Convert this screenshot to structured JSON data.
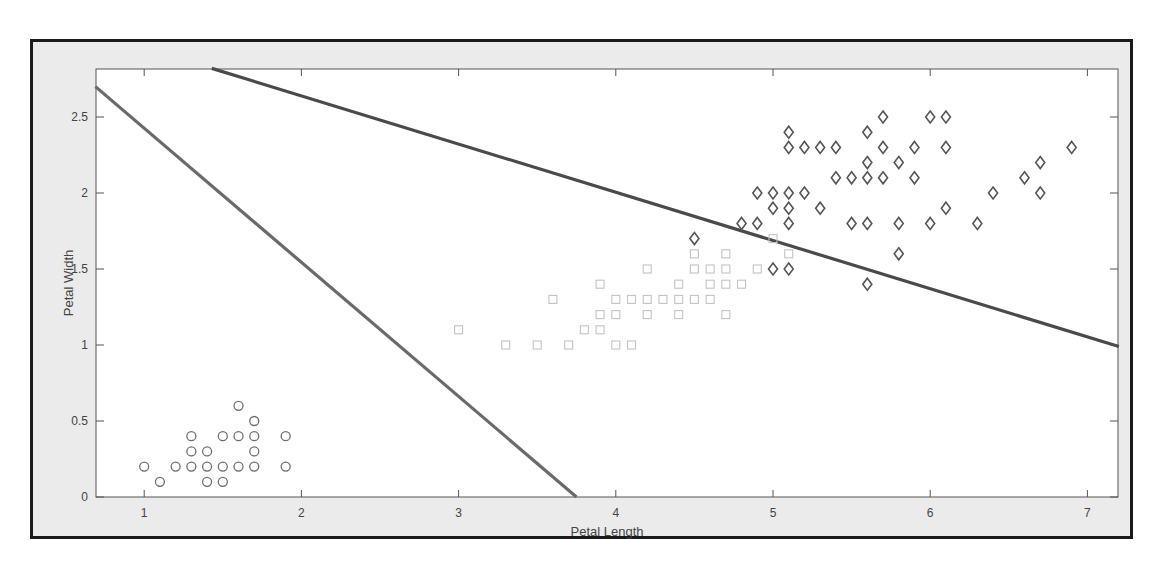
{
  "figure": {
    "frame_color": "#1a1a1a",
    "background": "#ebebeb",
    "axes_background": "#ffffff"
  },
  "chart_data": {
    "type": "scatter",
    "title": "",
    "xlabel": "Petal Length",
    "ylabel": "Petal Width",
    "xlim": [
      0.69,
      7.2
    ],
    "ylim": [
      0,
      2.82
    ],
    "xticks": [
      1,
      2,
      3,
      4,
      5,
      6,
      7
    ],
    "yticks": [
      0,
      0.5,
      1,
      1.5,
      2,
      2.5
    ],
    "xtick_labels": [
      "1",
      "2",
      "3",
      "4",
      "5",
      "6",
      "7"
    ],
    "ytick_labels": [
      "0",
      "0.5",
      "1",
      "1.5",
      "2",
      "2.5"
    ],
    "grid": false,
    "legend": null,
    "series": [
      {
        "name": "setosa",
        "marker": "circle",
        "color": "#6e6e6e",
        "points": [
          [
            1.0,
            0.2
          ],
          [
            1.1,
            0.1
          ],
          [
            1.2,
            0.2
          ],
          [
            1.3,
            0.2
          ],
          [
            1.3,
            0.3
          ],
          [
            1.3,
            0.4
          ],
          [
            1.4,
            0.1
          ],
          [
            1.4,
            0.2
          ],
          [
            1.4,
            0.3
          ],
          [
            1.5,
            0.1
          ],
          [
            1.5,
            0.2
          ],
          [
            1.5,
            0.4
          ],
          [
            1.6,
            0.2
          ],
          [
            1.6,
            0.4
          ],
          [
            1.6,
            0.6
          ],
          [
            1.7,
            0.2
          ],
          [
            1.7,
            0.3
          ],
          [
            1.7,
            0.4
          ],
          [
            1.7,
            0.5
          ],
          [
            1.9,
            0.2
          ],
          [
            1.9,
            0.4
          ]
        ]
      },
      {
        "name": "versicolor",
        "marker": "square",
        "color": "#c4c4c4",
        "points": [
          [
            3.0,
            1.1
          ],
          [
            3.3,
            1.0
          ],
          [
            3.5,
            1.0
          ],
          [
            3.6,
            1.3
          ],
          [
            3.7,
            1.0
          ],
          [
            3.8,
            1.1
          ],
          [
            3.9,
            1.1
          ],
          [
            3.9,
            1.2
          ],
          [
            3.9,
            1.4
          ],
          [
            4.0,
            1.0
          ],
          [
            4.0,
            1.2
          ],
          [
            4.0,
            1.3
          ],
          [
            4.1,
            1.0
          ],
          [
            4.1,
            1.3
          ],
          [
            4.2,
            1.2
          ],
          [
            4.2,
            1.3
          ],
          [
            4.2,
            1.5
          ],
          [
            4.3,
            1.3
          ],
          [
            4.4,
            1.2
          ],
          [
            4.4,
            1.3
          ],
          [
            4.4,
            1.4
          ],
          [
            4.5,
            1.3
          ],
          [
            4.5,
            1.5
          ],
          [
            4.5,
            1.6
          ],
          [
            4.6,
            1.3
          ],
          [
            4.6,
            1.4
          ],
          [
            4.6,
            1.5
          ],
          [
            4.7,
            1.2
          ],
          [
            4.7,
            1.4
          ],
          [
            4.7,
            1.5
          ],
          [
            4.7,
            1.6
          ],
          [
            4.8,
            1.4
          ],
          [
            4.9,
            1.5
          ],
          [
            5.0,
            1.7
          ],
          [
            5.1,
            1.6
          ]
        ]
      },
      {
        "name": "virginica",
        "marker": "diamond",
        "color": "#555555",
        "points": [
          [
            4.5,
            1.7
          ],
          [
            4.8,
            1.8
          ],
          [
            4.9,
            1.8
          ],
          [
            4.9,
            2.0
          ],
          [
            5.0,
            1.5
          ],
          [
            5.0,
            1.9
          ],
          [
            5.0,
            2.0
          ],
          [
            5.1,
            1.5
          ],
          [
            5.1,
            1.8
          ],
          [
            5.1,
            1.9
          ],
          [
            5.1,
            2.0
          ],
          [
            5.1,
            2.3
          ],
          [
            5.1,
            2.4
          ],
          [
            5.2,
            2.0
          ],
          [
            5.2,
            2.3
          ],
          [
            5.3,
            1.9
          ],
          [
            5.3,
            2.3
          ],
          [
            5.4,
            2.1
          ],
          [
            5.4,
            2.3
          ],
          [
            5.5,
            1.8
          ],
          [
            5.5,
            2.1
          ],
          [
            5.6,
            1.4
          ],
          [
            5.6,
            1.8
          ],
          [
            5.6,
            2.1
          ],
          [
            5.6,
            2.2
          ],
          [
            5.6,
            2.4
          ],
          [
            5.7,
            2.1
          ],
          [
            5.7,
            2.3
          ],
          [
            5.7,
            2.5
          ],
          [
            5.8,
            1.6
          ],
          [
            5.8,
            1.8
          ],
          [
            5.8,
            2.2
          ],
          [
            5.9,
            2.1
          ],
          [
            5.9,
            2.3
          ],
          [
            6.0,
            1.8
          ],
          [
            6.0,
            2.5
          ],
          [
            6.1,
            1.9
          ],
          [
            6.1,
            2.3
          ],
          [
            6.1,
            2.5
          ],
          [
            6.3,
            1.8
          ],
          [
            6.4,
            2.0
          ],
          [
            6.6,
            2.1
          ],
          [
            6.7,
            2.0
          ],
          [
            6.7,
            2.2
          ],
          [
            6.9,
            2.3
          ]
        ]
      }
    ],
    "lines": [
      {
        "name": "decision-boundary-1",
        "color": "#6a6a6a",
        "x": [
          0.69,
          3.75
        ],
        "y": [
          2.7,
          0
        ]
      },
      {
        "name": "decision-boundary-2",
        "color": "#4a4a4a",
        "x": [
          1.43,
          7.2
        ],
        "y": [
          2.82,
          0.99
        ]
      }
    ]
  }
}
